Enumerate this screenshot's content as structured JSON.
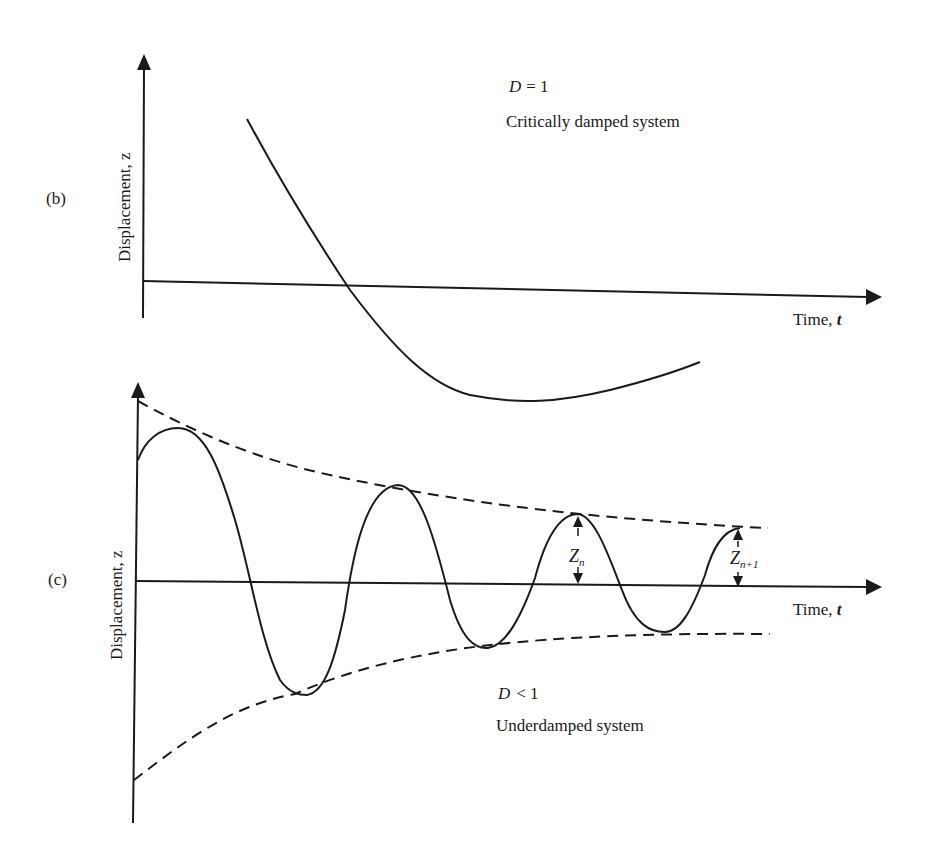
{
  "panel_b": {
    "label": "(b)",
    "y_axis_label": "Displacement, z",
    "x_axis_label_text": "Time, ",
    "x_axis_label_var": "t",
    "condition_var": "D",
    "condition_rel": "= 1",
    "description": "Critically damped system"
  },
  "panel_c": {
    "label": "(c)",
    "y_axis_label": "Displacement, z",
    "x_axis_label_text": "Time, ",
    "x_axis_label_var": "t",
    "condition_var": "D",
    "condition_rel": "< 1",
    "description": "Underdamped system",
    "amplitude_n": "Z",
    "amplitude_n_sub": "n",
    "amplitude_n1": "Z",
    "amplitude_n1_sub": "n+1"
  },
  "colors": {
    "ink": "#1a1a1a",
    "background": "#ffffff"
  }
}
